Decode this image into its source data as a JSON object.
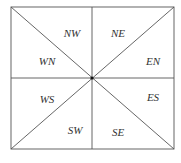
{
  "diagram": {
    "type": "octant-division",
    "frame": {
      "left": 11,
      "top": 7,
      "right": 174,
      "bottom": 149
    },
    "center": {
      "x": 92,
      "y": 78
    },
    "stroke_color": "#555555",
    "center_dot_color": "#111111",
    "regions": [
      {
        "id": "NW",
        "label": "NW",
        "x": 72,
        "y": 37
      },
      {
        "id": "NE",
        "label": "NE",
        "x": 118,
        "y": 37
      },
      {
        "id": "WN",
        "label": "WN",
        "x": 47,
        "y": 65
      },
      {
        "id": "EN",
        "label": "EN",
        "x": 153,
        "y": 65
      },
      {
        "id": "WS",
        "label": "WS",
        "x": 47,
        "y": 103
      },
      {
        "id": "ES",
        "label": "ES",
        "x": 153,
        "y": 101
      },
      {
        "id": "SW",
        "label": "SW",
        "x": 75,
        "y": 134
      },
      {
        "id": "SE",
        "label": "SE",
        "x": 118,
        "y": 136
      }
    ]
  }
}
